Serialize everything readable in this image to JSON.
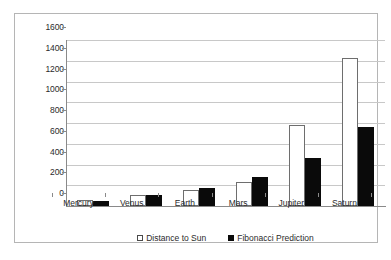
{
  "chart_data": {
    "type": "bar",
    "title": "",
    "xlabel": "",
    "ylabel": "",
    "categories": [
      "Mercury",
      "Venus",
      "Earth",
      "Mars",
      "Jupiter",
      "Saturn"
    ],
    "series": [
      {
        "name": "Distance to Sun",
        "color": "#ffffff",
        "values": [
          58,
          108,
          150,
          228,
          778,
          1427
        ]
      },
      {
        "name": "Fibonacci Prediction",
        "color": "#0a0a0a",
        "values": [
          45,
          105,
          175,
          280,
          460,
          760
        ]
      }
    ],
    "ylim": [
      0,
      1600
    ],
    "yticks": [
      "0",
      "200",
      "400",
      "600",
      "800",
      "1000",
      "1200",
      "1400",
      "1600"
    ],
    "ytick_values": [
      0,
      200,
      400,
      600,
      800,
      1000,
      1200,
      1400,
      1600
    ],
    "grid": true,
    "legend_position": "bottom"
  },
  "legend": {
    "items": [
      {
        "label": "Distance to Sun",
        "swatch": "white-square-icon"
      },
      {
        "label": "Fibonacci Prediction",
        "swatch": "black-square-icon"
      }
    ]
  }
}
